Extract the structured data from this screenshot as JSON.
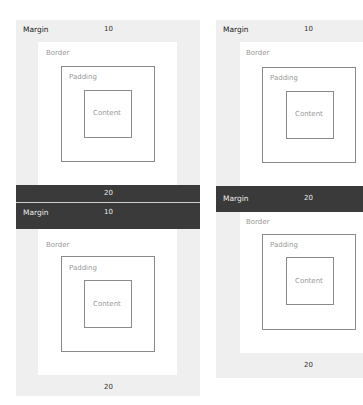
{
  "left": {
    "top": {
      "margin_label": "Margin",
      "margin_value": "10",
      "border_label": "Border",
      "padding_label": "Padding",
      "content_label": "Content"
    },
    "collapsed_bar_value": "20",
    "bottom": {
      "margin_label": "Margin",
      "margin_value": "10",
      "border_label": "Border",
      "padding_label": "Padding",
      "content_label": "Content",
      "bottom_margin_value": "20"
    }
  },
  "right": {
    "top": {
      "margin_label": "Margin",
      "margin_value": "10",
      "border_label": "Border",
      "padding_label": "Padding",
      "content_label": "Content"
    },
    "collapsed_bar": {
      "margin_label": "Margin",
      "margin_value": "20"
    },
    "bottom": {
      "border_label": "Border",
      "padding_label": "Padding",
      "content_label": "Content",
      "bottom_margin_value": "20"
    }
  },
  "colors": {
    "margin_bg": "#efefef",
    "collapsed_bar": "#3a3a3a",
    "box_border": "#8a8a8a"
  }
}
